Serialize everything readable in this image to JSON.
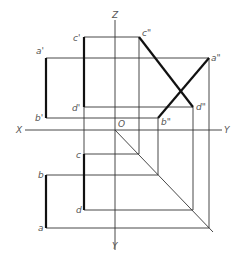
{
  "diagram": {
    "type": "orthographic-projection",
    "axes": {
      "z_label": "Z",
      "x_label": "X",
      "y_right_label": "Y",
      "y_bottom_label": "Y",
      "origin_label": "O"
    },
    "front_view": {
      "points": {
        "a_prime": "a'",
        "b_prime": "b'",
        "c_prime": "c'",
        "d_prime": "d'"
      }
    },
    "side_view": {
      "points": {
        "a_dprime": "a\"",
        "b_dprime": "b\"",
        "c_dprime": "c\"",
        "d_dprime": "d\""
      }
    },
    "top_view": {
      "points": {
        "a": "a",
        "b": "b",
        "c": "c",
        "d": "d"
      }
    },
    "colors": {
      "line": "#333333",
      "thick_line": "#111111",
      "label": "#555555"
    }
  }
}
